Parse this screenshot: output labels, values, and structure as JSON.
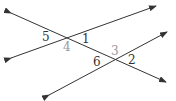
{
  "diagram": {
    "type": "two lines crossed by a transversal",
    "colors": {
      "line": "#333333",
      "label_dark": "#333333",
      "label_light": "#999999",
      "background": "#ffffff"
    },
    "lines": [
      {
        "id": "transversal",
        "from": [
          11,
          13
        ],
        "to": [
          166,
          82
        ]
      },
      {
        "id": "upper-line",
        "from": [
          11,
          58
        ],
        "to": [
          156,
          6
        ]
      },
      {
        "id": "lower-line",
        "from": [
          49,
          95
        ],
        "to": [
          167,
          32
        ]
      }
    ],
    "labels": {
      "a5": "5",
      "a1": "1",
      "a4": "4",
      "a3": "3",
      "a6": "6",
      "a2": "2"
    }
  }
}
